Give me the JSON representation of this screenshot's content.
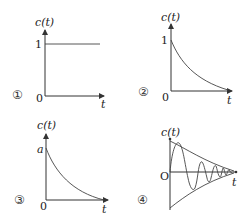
{
  "figure": {
    "panels": [
      {
        "marker": "①",
        "ylabel": "c(t)",
        "xlabel": "t",
        "origin": "0",
        "ytick": "1",
        "curve": "step (constant at 1)"
      },
      {
        "marker": "②",
        "ylabel": "c(t)",
        "xlabel": "t",
        "origin": "0",
        "ytick": "1",
        "curve": "exponential decay from 1"
      },
      {
        "marker": "③",
        "ylabel": "c(t)",
        "xlabel": "t",
        "origin": "0",
        "ytick": "a",
        "curve": "exponential decay from a"
      },
      {
        "marker": "④",
        "ylabel": "c(t)",
        "xlabel": "t",
        "origin": "O",
        "ytick": "",
        "curve": "damped oscillation within exponential envelope"
      }
    ]
  }
}
